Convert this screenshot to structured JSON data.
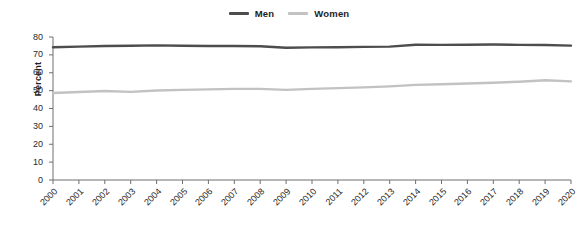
{
  "chart_data": {
    "type": "line",
    "title": "",
    "xlabel": "",
    "ylabel": "Percent",
    "ylim": [
      0,
      80
    ],
    "yticks": [
      0,
      10,
      20,
      30,
      40,
      50,
      60,
      70,
      80
    ],
    "grid": false,
    "legend_position": "top-center",
    "x": [
      2000,
      2001,
      2002,
      2003,
      2004,
      2005,
      2006,
      2007,
      2008,
      2009,
      2010,
      2011,
      2012,
      2013,
      2014,
      2015,
      2016,
      2017,
      2018,
      2019,
      2020
    ],
    "categories": [
      "2000",
      "2001",
      "2002",
      "2003",
      "2004",
      "2005",
      "2006",
      "2007",
      "2008",
      "2009",
      "2010",
      "2011",
      "2012",
      "2013",
      "2014",
      "2015",
      "2016",
      "2017",
      "2018",
      "2019",
      "2020"
    ],
    "series": [
      {
        "name": "Men",
        "color": "#4d4d4d",
        "values": [
          74.3,
          74.6,
          75.0,
          75.1,
          75.3,
          75.1,
          75.0,
          75.0,
          74.8,
          74.0,
          74.2,
          74.3,
          74.5,
          74.6,
          75.7,
          75.6,
          75.7,
          75.8,
          75.6,
          75.5,
          75.2
        ]
      },
      {
        "name": "Women",
        "color": "#c2c2c2",
        "values": [
          48.7,
          49.2,
          49.8,
          49.3,
          50.1,
          50.4,
          50.7,
          51.0,
          51.0,
          50.4,
          51.0,
          51.4,
          51.8,
          52.4,
          53.2,
          53.6,
          54.0,
          54.4,
          55.0,
          55.8,
          55.2
        ]
      }
    ],
    "legend": [
      {
        "label": "Men",
        "color": "#4d4d4d"
      },
      {
        "label": "Women",
        "color": "#c2c2c2"
      }
    ],
    "axis_color": "#6e6e6e"
  }
}
